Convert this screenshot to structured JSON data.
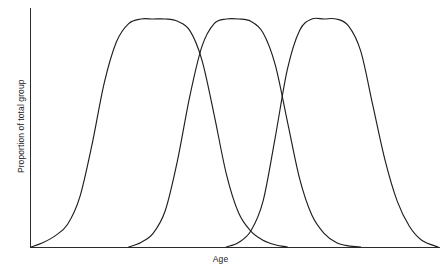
{
  "figure": {
    "background_color": "#ffffff",
    "line_color": "#1f1f1f",
    "axis_color": "#2b2b2b"
  },
  "axes": {
    "xlabel": "Age",
    "ylabel": "Proportion of total group"
  },
  "chart_data": {
    "type": "line",
    "title": "",
    "subtitle": "",
    "xlabel": "Age",
    "ylabel": "Proportion of total group",
    "xlim": [
      0,
      100
    ],
    "ylim": [
      0,
      1
    ],
    "grid": false,
    "legend": null,
    "legend_position": "none",
    "tick_labels_x": [],
    "tick_labels_y": [],
    "annotations": [],
    "series": [
      {
        "name": "Curve 1",
        "peak_x": 22,
        "peak_y": 1.0,
        "x": [
          0,
          3,
          6,
          9,
          12,
          15,
          18,
          21,
          24,
          27,
          30,
          33,
          36,
          39,
          42,
          45,
          48,
          51,
          54,
          57,
          60,
          63
        ],
        "y": [
          0.0,
          0.02,
          0.05,
          0.1,
          0.22,
          0.45,
          0.72,
          0.9,
          0.98,
          1.0,
          1.0,
          1.0,
          0.99,
          0.95,
          0.82,
          0.58,
          0.32,
          0.15,
          0.07,
          0.03,
          0.01,
          0.0
        ]
      },
      {
        "name": "Curve 2",
        "peak_x": 47,
        "peak_y": 1.0,
        "x": [
          24,
          27,
          30,
          33,
          36,
          39,
          42,
          45,
          48,
          51,
          54,
          57,
          60,
          63,
          66,
          69,
          72,
          75,
          78,
          81
        ],
        "y": [
          0.0,
          0.02,
          0.06,
          0.16,
          0.38,
          0.66,
          0.88,
          0.98,
          1.0,
          1.0,
          0.99,
          0.94,
          0.8,
          0.55,
          0.3,
          0.14,
          0.06,
          0.02,
          0.005,
          0.0
        ]
      },
      {
        "name": "Curve 3",
        "peak_x": 71,
        "peak_y": 1.0,
        "x": [
          48,
          51,
          54,
          57,
          60,
          63,
          66,
          69,
          72,
          75,
          78,
          81,
          84,
          87,
          90,
          93,
          96,
          100
        ],
        "y": [
          0.0,
          0.02,
          0.07,
          0.2,
          0.48,
          0.78,
          0.95,
          1.0,
          1.0,
          1.0,
          0.97,
          0.86,
          0.62,
          0.38,
          0.2,
          0.09,
          0.03,
          0.0
        ]
      }
    ],
    "crossings": [
      {
        "between": [
          "Curve 1",
          "Curve 2"
        ],
        "x": 43,
        "y": 0.83
      },
      {
        "between": [
          "Curve 2",
          "Curve 3"
        ],
        "x": 66,
        "y": 0.83
      },
      {
        "between": [
          "Curve 1",
          "Curve 3"
        ],
        "x": 55,
        "y": 0.04
      }
    ]
  }
}
